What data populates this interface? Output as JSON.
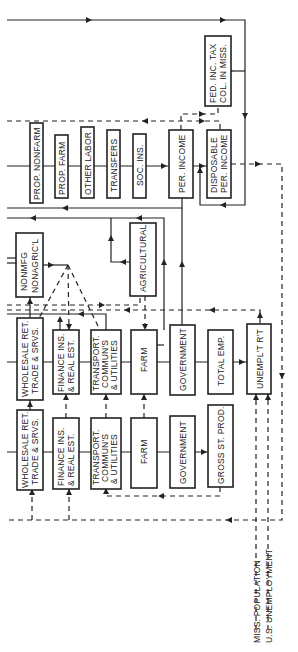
{
  "diagram": {
    "orientation": "rotated 90° counter-clockwise (text reads bottom-to-top)",
    "row_income": {
      "boxes": [
        {
          "id": "prop_nonfarm",
          "label": "PROP. NONFARM"
        },
        {
          "id": "prop_farm",
          "label": "PROP. FARM"
        },
        {
          "id": "other_labor",
          "label": "OTHER LABOR"
        },
        {
          "id": "transfers",
          "label": "TRANSFERS"
        },
        {
          "id": "soc_ins",
          "label": "SOC. INS."
        },
        {
          "id": "per_income",
          "label": "PER. INCOME"
        },
        {
          "id": "disposable",
          "line1": "DISPOSABLE",
          "line2": "PER. INCOME"
        }
      ]
    },
    "fed_tax": {
      "line1": "FED. INC. TAX",
      "line2": "COL. IN MISS."
    },
    "mid_boxes": {
      "nonmfg": {
        "line1": "NONMFG",
        "line2": "NONAGRIC'L"
      },
      "agricultural": {
        "label": "AGRICULTURAL"
      }
    },
    "row_employment": {
      "boxes": [
        {
          "id": "wholesale",
          "line1": "WHOLESALE RET.",
          "line2": "TRADE & SRVS."
        },
        {
          "id": "finance",
          "line1": "FINANCE INS.",
          "line2": "& REAL EST."
        },
        {
          "id": "transport",
          "line1": "TRANSPORT.",
          "line2": "COMMUN'S",
          "line3": "& UTILITIES"
        },
        {
          "id": "farm",
          "label": "FARM"
        },
        {
          "id": "government",
          "label": "GOVERNMENT"
        },
        {
          "id": "total_emp",
          "label": "TOTAL EMP."
        },
        {
          "id": "unempl",
          "label": "UNEMPL'T R'T"
        }
      ]
    },
    "row_output": {
      "boxes": [
        {
          "id": "wholesale",
          "line1": "WHOLESALE RET.",
          "line2": "TRADE & SRVS."
        },
        {
          "id": "finance",
          "line1": "FINANCE INS.",
          "line2": "& REAL EST."
        },
        {
          "id": "transport",
          "line1": "TRANSPORT.",
          "line2": "COMMUN'S",
          "line3": "& UTILITIES"
        },
        {
          "id": "farm",
          "label": "FARM"
        },
        {
          "id": "government",
          "label": "GOVERNMENT"
        },
        {
          "id": "gross_st_prod",
          "label": "GROSS ST. PROD."
        }
      ]
    },
    "exogenous_inputs": [
      {
        "label": "MISS. POPULATION"
      },
      {
        "label": "U.S. UNEMPLOYMENT"
      }
    ]
  }
}
